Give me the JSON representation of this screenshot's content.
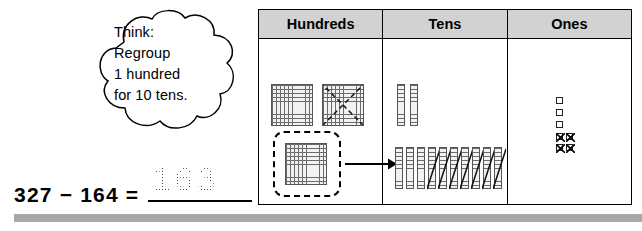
{
  "thought_bubble": {
    "name": "think-regroup-bubble",
    "lines": [
      "Think:",
      "Regroup",
      "1 hundred",
      "for 10 tens."
    ]
  },
  "equation": {
    "expression": "327 − 164 =",
    "minuend": 327,
    "subtrahend": 164,
    "answer": "163",
    "answer_style": "dotted-trace"
  },
  "chart": {
    "headers": [
      "Hundreds",
      "Tens",
      "Ones"
    ],
    "header_background": "#d2d2d2",
    "border_color": "#000000",
    "columns": [
      {
        "place": "Hundreds",
        "top_row_blocks": 2,
        "top_row_crossed_out": 1,
        "regrouped_block": 1,
        "regroup_marker": "dashed-rounded-rectangle",
        "arrow_to": "Tens",
        "block_grid": "10x10"
      },
      {
        "place": "Tens",
        "top_row_rods": 2,
        "bottom_row_rods": 10,
        "bottom_row_plain": 3,
        "bottom_row_crossed_out": 7,
        "rod_segments": 10
      },
      {
        "place": "Ones",
        "total_units": 7,
        "plain_units": 3,
        "crossed_out_units": 4
      }
    ]
  },
  "footer": {
    "bar_color": "#a8a8a8"
  }
}
